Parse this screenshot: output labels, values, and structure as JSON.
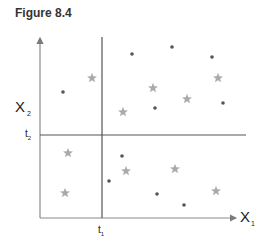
{
  "figure": {
    "title": "Figure 8.4",
    "x_axis_label": "X",
    "x_axis_sub": "1",
    "y_axis_label": "X",
    "y_axis_sub": "2",
    "t1_label": "t",
    "t1_sub": "1",
    "t2_label": "t",
    "t2_sub": "2"
  },
  "colors": {
    "axis": "#7a7a7a",
    "split_line": "#555555",
    "dot": "#555555",
    "star": "#aaaaaa"
  },
  "chart_data": {
    "type": "scatter",
    "title": "Figure 8.4",
    "xlabel": "X1",
    "ylabel": "X2",
    "thresholds": {
      "t1": "vertical split on X1",
      "t2": "horizontal split on X2"
    },
    "grid": false,
    "series": [
      {
        "name": "dots",
        "marker": "circle",
        "points_px": [
          [
            63,
            92
          ],
          [
            132,
            54
          ],
          [
            172,
            47
          ],
          [
            212,
            57
          ],
          [
            155,
            108
          ],
          [
            223,
            103
          ],
          [
            122,
            156
          ],
          [
            109,
            181
          ],
          [
            157,
            194
          ],
          [
            184,
            205
          ]
        ]
      },
      {
        "name": "stars",
        "marker": "star",
        "points_px": [
          [
            92,
            78
          ],
          [
            153,
            88
          ],
          [
            218,
            78
          ],
          [
            123,
            112
          ],
          [
            187,
            99
          ],
          [
            68,
            153
          ],
          [
            126,
            171
          ],
          [
            175,
            169
          ],
          [
            65,
            193
          ],
          [
            216,
            191
          ]
        ]
      }
    ]
  }
}
